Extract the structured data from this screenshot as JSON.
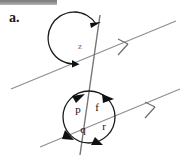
{
  "page": {
    "background_color": "#ffffff",
    "width": 187,
    "height": 163
  },
  "top_bar": {
    "name": "scan-artifact-bar",
    "color_dark": "#7d7d7d",
    "color_light": "#b9b9b9"
  },
  "item": {
    "label": "a."
  },
  "figure": {
    "title": "",
    "line_color": "#8a8a8a",
    "transversal_color": "#6f6f6f",
    "arc_color": "#1a1a1a",
    "parallel_marker": "single-chevron",
    "parallel_marker_count": 2,
    "angles": [
      {
        "id": "z",
        "label": "z",
        "location": "upper-intersection",
        "label_x": 80,
        "label_y": 47
      },
      {
        "id": "p",
        "label": "p",
        "location": "lower-intersection",
        "label_x": 78,
        "label_y": 110
      },
      {
        "id": "f",
        "label": "f",
        "location": "lower-intersection",
        "label_x": 97,
        "label_y": 108
      },
      {
        "id": "q",
        "label": "q",
        "location": "lower-intersection",
        "label_x": 83,
        "label_y": 129
      },
      {
        "id": "r",
        "label": "r",
        "location": "lower-intersection",
        "label_x": 103,
        "label_y": 127
      }
    ],
    "lower_circle": {
      "cx": 89,
      "cy": 117,
      "r": 26
    }
  }
}
